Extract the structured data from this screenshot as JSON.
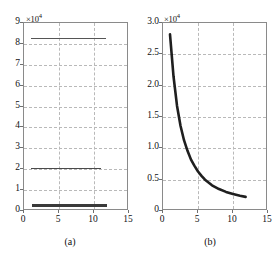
{
  "figure": {
    "background": "#ffffff",
    "line_color": "#2b2b2b",
    "grid_color": "#b9b9b9",
    "axis_color": "#8a8a8a"
  },
  "panels": [
    {
      "caption": "(a)",
      "multiplier": "×10",
      "multiplier_exp": "4"
    },
    {
      "caption": "(b)",
      "multiplier": "×10",
      "multiplier_exp": "4"
    }
  ],
  "chart_data": [
    {
      "type": "line",
      "panel": "(a)",
      "title": "",
      "xlabel": "",
      "ylabel": "",
      "xlim": [
        0,
        15
      ],
      "ylim": [
        0,
        90000
      ],
      "yscale_multiplier": 10000,
      "xticks": [
        0,
        5,
        10,
        15
      ],
      "xticklabels": [
        "0",
        "5",
        "10",
        "15"
      ],
      "yticks": [
        0,
        10000,
        20000,
        30000,
        40000,
        50000,
        60000,
        70000,
        80000,
        90000
      ],
      "yticklabels": [
        "0",
        "1",
        "2",
        "3",
        "4",
        "5",
        "6",
        "7",
        "8",
        "9"
      ],
      "grid": true,
      "legend": null,
      "series": [
        {
          "name": "upper-flat-trace",
          "style": "thin",
          "x": [
            1.0,
            11.7
          ],
          "values": [
            83000,
            83000
          ],
          "comment": "near-constant trace at about 8.3e4"
        },
        {
          "name": "middle-flat-trace",
          "style": "medium",
          "x": [
            1.0,
            11.0
          ],
          "values": [
            20800,
            20800
          ],
          "comment": "near-constant trace just above the 2e4 gridline"
        },
        {
          "name": "lower-flat-trace",
          "style": "thick",
          "x": [
            1.2,
            11.8
          ],
          "values": [
            3000,
            3000
          ],
          "comment": "thick near-constant trace at about 0.3e4"
        }
      ]
    },
    {
      "type": "line",
      "panel": "(b)",
      "title": "",
      "xlabel": "",
      "ylabel": "",
      "xlim": [
        0,
        15
      ],
      "ylim": [
        0,
        30000
      ],
      "yscale_multiplier": 10000,
      "xticks": [
        0,
        5,
        10,
        15
      ],
      "xticklabels": [
        "0",
        "5",
        "10",
        "15"
      ],
      "yticks": [
        0,
        5000,
        10000,
        15000,
        20000,
        25000,
        30000
      ],
      "yticklabels": [
        "0",
        "0.5",
        "1.0",
        "1.5",
        "2.0",
        "2.5",
        "3.0"
      ],
      "grid": true,
      "legend": null,
      "series": [
        {
          "name": "decay-curve",
          "style": "thick",
          "x": [
            1.0,
            1.5,
            2.0,
            2.5,
            3.0,
            3.5,
            4.0,
            4.5,
            5.0,
            5.5,
            6.0,
            7.0,
            8.0,
            9.0,
            10.0,
            11.0,
            11.8
          ],
          "values": [
            28200,
            21500,
            16800,
            13600,
            11300,
            9600,
            8200,
            7200,
            6300,
            5600,
            5000,
            4100,
            3500,
            3050,
            2700,
            2420,
            2250
          ],
          "comment": "monotonic hyperbolic decay from about 2.82e4 down to about 0.22e4"
        }
      ]
    }
  ]
}
